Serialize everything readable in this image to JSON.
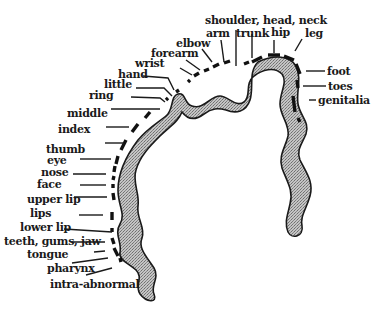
{
  "diagram": {
    "title": "",
    "labels": {
      "shoulder_head_neck": "shoulder, head, neck",
      "arm": "arm",
      "trunk": "trunk",
      "hip": "hip",
      "leg": "leg",
      "elbow": "elbow",
      "forearm": "forearm",
      "wrist": "wrist",
      "hand": "hand",
      "little": "little",
      "ring": "ring",
      "middle": "middle",
      "index": "index",
      "thumb": "thumb",
      "eye": "eye",
      "nose": "nose",
      "face": "face",
      "upper_lip": "upper lip",
      "lips": "lips",
      "lower_lip": "lower lip",
      "teeth_gums_jaw": "teeth, gums, jaw",
      "tongue": "tongue",
      "pharynx": "pharynx",
      "intra_abnormal": "intra-abnormal",
      "foot": "foot",
      "toes": "toes",
      "genitalia": "genitalia"
    },
    "colors": {
      "ink": "#1a1a1a",
      "fill": "#9a9a9a",
      "background": "#ffffff"
    }
  }
}
